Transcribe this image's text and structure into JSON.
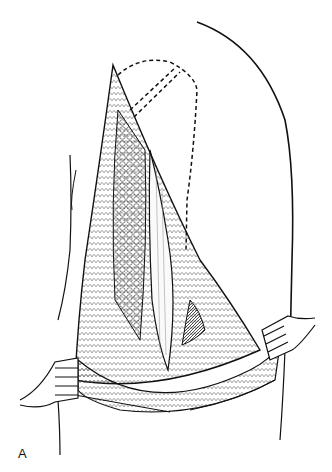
{
  "figure": {
    "panel_label": "A",
    "colors": {
      "line": "#111111",
      "background": "#ffffff",
      "shadow": "#333333"
    }
  }
}
